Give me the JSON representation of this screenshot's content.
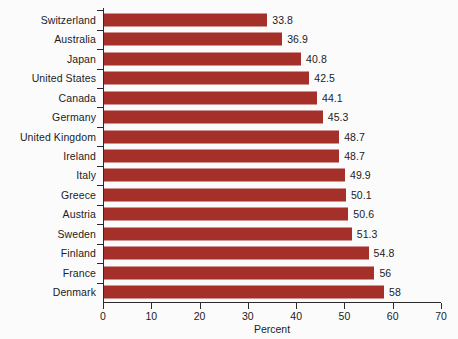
{
  "chart_data": {
    "type": "bar",
    "orientation": "horizontal",
    "title": "",
    "xlabel": "Percent",
    "ylabel": "",
    "xlim": [
      0,
      70
    ],
    "xticks": [
      0,
      10,
      20,
      30,
      40,
      50,
      60,
      70
    ],
    "grid": false,
    "legend": null,
    "bar_color": "#a5302a",
    "background_color": "#fbfbfc",
    "text_color": "#1c1c1c",
    "categories": [
      "Switzerland",
      "Australia",
      "Japan",
      "United States",
      "Canada",
      "Germany",
      "United Kingdom",
      "Ireland",
      "Italy",
      "Greece",
      "Austria",
      "Sweden",
      "Finland",
      "France",
      "Denmark"
    ],
    "values": [
      33.8,
      36.9,
      40.8,
      42.5,
      44.1,
      45.3,
      48.7,
      48.7,
      49.9,
      50.1,
      50.6,
      51.3,
      54.8,
      56,
      58
    ],
    "value_labels": [
      "33.8",
      "36.9",
      "40.8",
      "42.5",
      "44.1",
      "45.3",
      "48.7",
      "48.7",
      "49.9",
      "50.1",
      "50.6",
      "51.3",
      "54.8",
      "56",
      "58"
    ]
  }
}
